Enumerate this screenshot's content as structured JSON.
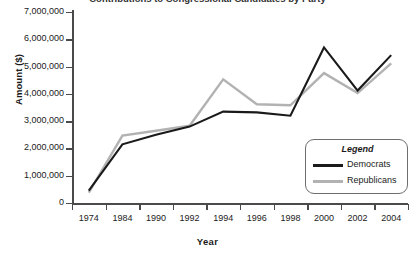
{
  "chart_data": {
    "type": "line",
    "title": "Contributions to Congressional Candidates by Party",
    "xlabel": "Year",
    "ylabel": "Amount ($)",
    "categories": [
      "1974",
      "1984",
      "1990",
      "1992",
      "1994",
      "1996",
      "1998",
      "2000",
      "2002",
      "2004"
    ],
    "series": [
      {
        "name": "Democrats",
        "color": "#1a1a1a",
        "values": [
          450000,
          2150000,
          2500000,
          2800000,
          3350000,
          3320000,
          3200000,
          5700000,
          4120000,
          5420000
        ]
      },
      {
        "name": "Republicans",
        "color": "#b2b2b2",
        "values": [
          380000,
          2470000,
          2650000,
          2830000,
          4530000,
          3620000,
          3580000,
          4760000,
          4030000,
          5120000
        ]
      }
    ],
    "ylim": [
      0,
      7000000
    ],
    "ytick_labels": [
      "0",
      "1,000,000",
      "2,000,000",
      "3,000,000",
      "4,000,000",
      "5,000,000",
      "6,000,000",
      "7,000,000"
    ],
    "ytick_values": [
      0,
      1000000,
      2000000,
      3000000,
      4000000,
      5000000,
      6000000,
      7000000
    ],
    "grid": false,
    "legend_position": "inside-bottom-right"
  },
  "legend": {
    "title": "Legend",
    "entries": [
      {
        "label": "Democrats",
        "color": "#1a1a1a"
      },
      {
        "label": "Republicans",
        "color": "#b2b2b2"
      }
    ]
  },
  "axes": {
    "x_title": "Year",
    "y_title": "Amount ($)"
  }
}
